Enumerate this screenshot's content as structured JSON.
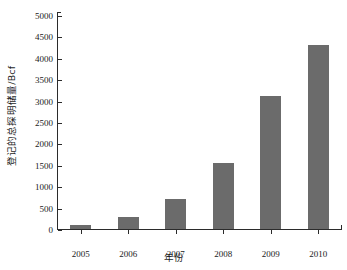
{
  "chart_data": {
    "type": "bar",
    "title": "",
    "xlabel": "年份",
    "ylabel": "登记的总探明储量/Bcf",
    "categories": [
      "2005",
      "2006",
      "2007",
      "2008",
      "2009",
      "2010"
    ],
    "values": [
      100,
      280,
      700,
      1540,
      3110,
      4290
    ],
    "series": [
      {
        "name": "登记的总探明储量",
        "values": [
          100,
          280,
          700,
          1540,
          3110,
          4290
        ]
      }
    ],
    "ylim": [
      0,
      5000
    ],
    "yticks": [
      0,
      500,
      1000,
      1500,
      2000,
      2500,
      3000,
      3500,
      4000,
      4500,
      5000
    ],
    "ytick_labels": [
      "0",
      "500",
      "1000",
      "1500",
      "2000",
      "2500",
      "3000",
      "3500",
      "4000",
      "4500",
      "5000"
    ],
    "xtick_labels": [
      "2005",
      "2006",
      "2007",
      "2008",
      "2009",
      "2010"
    ],
    "grid": false,
    "legend": null,
    "legend_position": "none",
    "bar_color": "#6b6b6b",
    "axis_color": "#2b2b2b",
    "background_color": "#ffffff",
    "units": "Bcf"
  }
}
